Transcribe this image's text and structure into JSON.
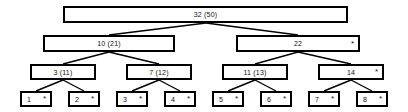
{
  "diagram": {
    "type": "b-plus-tree",
    "background_color": "#ffffff",
    "border_color": "#000000",
    "text_color": "#111111",
    "pointer_symbol": "*"
  },
  "levels": [
    {
      "name": "root-level",
      "nodes": [
        {
          "id": "root",
          "label": "32  (50)",
          "keys": [
            "32",
            "(50)"
          ],
          "pointer": "",
          "x": 63,
          "y": 6,
          "w": 285,
          "h": 17
        }
      ]
    },
    {
      "name": "internal-level-2",
      "nodes": [
        {
          "id": "n-10-21",
          "label": "10  (21)",
          "keys": [
            "10",
            "(21)"
          ],
          "pointer": "",
          "x": 43,
          "y": 35,
          "w": 132,
          "h": 17
        },
        {
          "id": "n-22",
          "label": "22",
          "keys": [
            "22"
          ],
          "pointer": "*",
          "x": 236,
          "y": 35,
          "w": 124,
          "h": 17
        }
      ]
    },
    {
      "name": "internal-level-3",
      "nodes": [
        {
          "id": "n-3-11",
          "label": "3  (11)",
          "keys": [
            "3",
            "(11)"
          ],
          "pointer": "",
          "x": 30,
          "y": 64,
          "w": 66,
          "h": 16
        },
        {
          "id": "n-7-12",
          "label": "7  (12)",
          "keys": [
            "7",
            "(12)"
          ],
          "pointer": "",
          "x": 126,
          "y": 64,
          "w": 66,
          "h": 16
        },
        {
          "id": "n-11-13",
          "label": "11  (13)",
          "keys": [
            "11",
            "(13)"
          ],
          "pointer": "",
          "x": 222,
          "y": 64,
          "w": 66,
          "h": 16
        },
        {
          "id": "n-14",
          "label": "14",
          "keys": [
            "14"
          ],
          "pointer": "*",
          "x": 318,
          "y": 64,
          "w": 66,
          "h": 16
        }
      ]
    },
    {
      "name": "leaf-level",
      "nodes": [
        {
          "id": "leaf-1",
          "label": "1",
          "keys": [
            "1"
          ],
          "pointer": "*",
          "x": 20,
          "y": 91,
          "w": 32,
          "h": 16
        },
        {
          "id": "leaf-2",
          "label": "2",
          "keys": [
            "2"
          ],
          "pointer": "*",
          "x": 68,
          "y": 91,
          "w": 32,
          "h": 16
        },
        {
          "id": "leaf-3",
          "label": "3",
          "keys": [
            "3"
          ],
          "pointer": "*",
          "x": 116,
          "y": 91,
          "w": 32,
          "h": 16
        },
        {
          "id": "leaf-4",
          "label": "4",
          "keys": [
            "4"
          ],
          "pointer": "*",
          "x": 164,
          "y": 91,
          "w": 32,
          "h": 16
        },
        {
          "id": "leaf-5",
          "label": "5",
          "keys": [
            "5"
          ],
          "pointer": "*",
          "x": 212,
          "y": 91,
          "w": 32,
          "h": 16
        },
        {
          "id": "leaf-6",
          "label": "6",
          "keys": [
            "6"
          ],
          "pointer": "*",
          "x": 260,
          "y": 91,
          "w": 32,
          "h": 16
        },
        {
          "id": "leaf-7",
          "label": "7",
          "keys": [
            "7"
          ],
          "pointer": "*",
          "x": 308,
          "y": 91,
          "w": 32,
          "h": 16
        },
        {
          "id": "leaf-8",
          "label": "8",
          "keys": [
            "8"
          ],
          "pointer": "*",
          "x": 356,
          "y": 91,
          "w": 32,
          "h": 16
        }
      ]
    }
  ],
  "edges": [
    {
      "from": "root",
      "to": "n-10-21",
      "x1": 206,
      "y1": 23,
      "x2": 109,
      "y2": 35
    },
    {
      "from": "root",
      "to": "n-22",
      "x1": 206,
      "y1": 23,
      "x2": 298,
      "y2": 35
    },
    {
      "from": "n-10-21",
      "to": "n-3-11",
      "x1": 109,
      "y1": 52,
      "x2": 63,
      "y2": 64
    },
    {
      "from": "n-10-21",
      "to": "n-7-12",
      "x1": 109,
      "y1": 52,
      "x2": 159,
      "y2": 64
    },
    {
      "from": "n-22",
      "to": "n-11-13",
      "x1": 298,
      "y1": 52,
      "x2": 255,
      "y2": 64
    },
    {
      "from": "n-22",
      "to": "n-14",
      "x1": 298,
      "y1": 52,
      "x2": 351,
      "y2": 64
    },
    {
      "from": "n-3-11",
      "to": "leaf-1",
      "x1": 63,
      "y1": 80,
      "x2": 36,
      "y2": 91
    },
    {
      "from": "n-3-11",
      "to": "leaf-2",
      "x1": 63,
      "y1": 80,
      "x2": 84,
      "y2": 91
    },
    {
      "from": "n-7-12",
      "to": "leaf-3",
      "x1": 159,
      "y1": 80,
      "x2": 132,
      "y2": 91
    },
    {
      "from": "n-7-12",
      "to": "leaf-4",
      "x1": 159,
      "y1": 80,
      "x2": 180,
      "y2": 91
    },
    {
      "from": "n-11-13",
      "to": "leaf-5",
      "x1": 255,
      "y1": 80,
      "x2": 228,
      "y2": 91
    },
    {
      "from": "n-11-13",
      "to": "leaf-6",
      "x1": 255,
      "y1": 80,
      "x2": 276,
      "y2": 91
    },
    {
      "from": "n-14",
      "to": "leaf-7",
      "x1": 351,
      "y1": 80,
      "x2": 324,
      "y2": 91
    },
    {
      "from": "n-14",
      "to": "leaf-8",
      "x1": 351,
      "y1": 80,
      "x2": 372,
      "y2": 91
    }
  ]
}
